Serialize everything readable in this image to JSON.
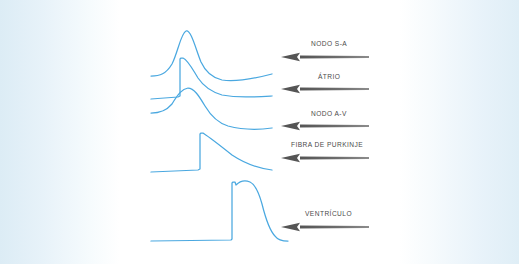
{
  "figure": {
    "background_color": "#ffffff",
    "edge_tint_color": "#dcecf5",
    "trace_color": "#4aa8e0",
    "arrow_color": "#5f5f5f",
    "label_color": "#4a4a4a",
    "width": 519,
    "height": 264
  },
  "annotations": [
    {
      "id": "nodo-sa",
      "label": "NODO S-A",
      "label_x": 311,
      "label_y": 40,
      "arrow_y": 57,
      "arrow_x_tip": 281,
      "arrow_x_tail": 369
    },
    {
      "id": "atrio",
      "label": "ÁTRIO",
      "label_x": 318,
      "label_y": 73,
      "arrow_y": 89,
      "arrow_x_tip": 281,
      "arrow_x_tail": 369
    },
    {
      "id": "nodo-av",
      "label": "NODO A-V",
      "label_x": 311,
      "label_y": 110,
      "arrow_y": 126,
      "arrow_x_tip": 281,
      "arrow_x_tail": 369
    },
    {
      "id": "fibra-de-purkinje",
      "label": "FIBRA DE PURKINJE",
      "label_x": 291,
      "label_y": 141,
      "arrow_y": 158,
      "arrow_x_tip": 281,
      "arrow_x_tail": 369
    },
    {
      "id": "ventriculo",
      "label": "VENTRÍCULO",
      "label_x": 305,
      "label_y": 210,
      "arrow_y": 227,
      "arrow_x_tip": 281,
      "arrow_x_tail": 369
    }
  ],
  "traces": [
    {
      "id": "trace-nodo-sa",
      "name": "nodo-sa-action-potential",
      "path": "M 151 76 C 160 76 166 74 172 64 C 178 52 181 33 186 31 C 191 29 196 50 201 62 C 206 73 213 78 222 80 C 236 82 253 79 272 74"
    },
    {
      "id": "trace-atrio",
      "name": "atrio-action-potential",
      "path": "M 151 99 L 178 97 L 180 96 L 180 59 L 181 58 L 183 58 C 188 60 193 70 198 78 C 204 87 212 92 222 95 C 238 98 254 97 272 96"
    },
    {
      "id": "trace-nodo-av",
      "name": "nodo-av-action-potential",
      "path": "M 151 113 C 160 113 166 111 172 104 C 178 94 182 89 188 88 C 194 88 199 96 205 106 C 211 116 218 123 228 126 C 243 130 258 130 272 128"
    },
    {
      "id": "trace-fibra-purkinje",
      "name": "fibra-de-purkinje-action-potential",
      "path": "M 151 172 L 198 170 L 200 169 L 200 134 L 201 133 L 203 133 C 212 139 222 147 232 155 C 244 163 256 168 272 170"
    },
    {
      "id": "trace-ventriculo",
      "name": "ventriculo-action-potential",
      "path": "M 151 241 L 231 240 L 232 239 L 232 183 L 233 182 L 235 182 L 236 185 C 240 181 245 180 250 182 C 256 185 259 193 262 204 C 265 216 269 230 275 236 C 278 240 283 241 288 241"
    }
  ]
}
